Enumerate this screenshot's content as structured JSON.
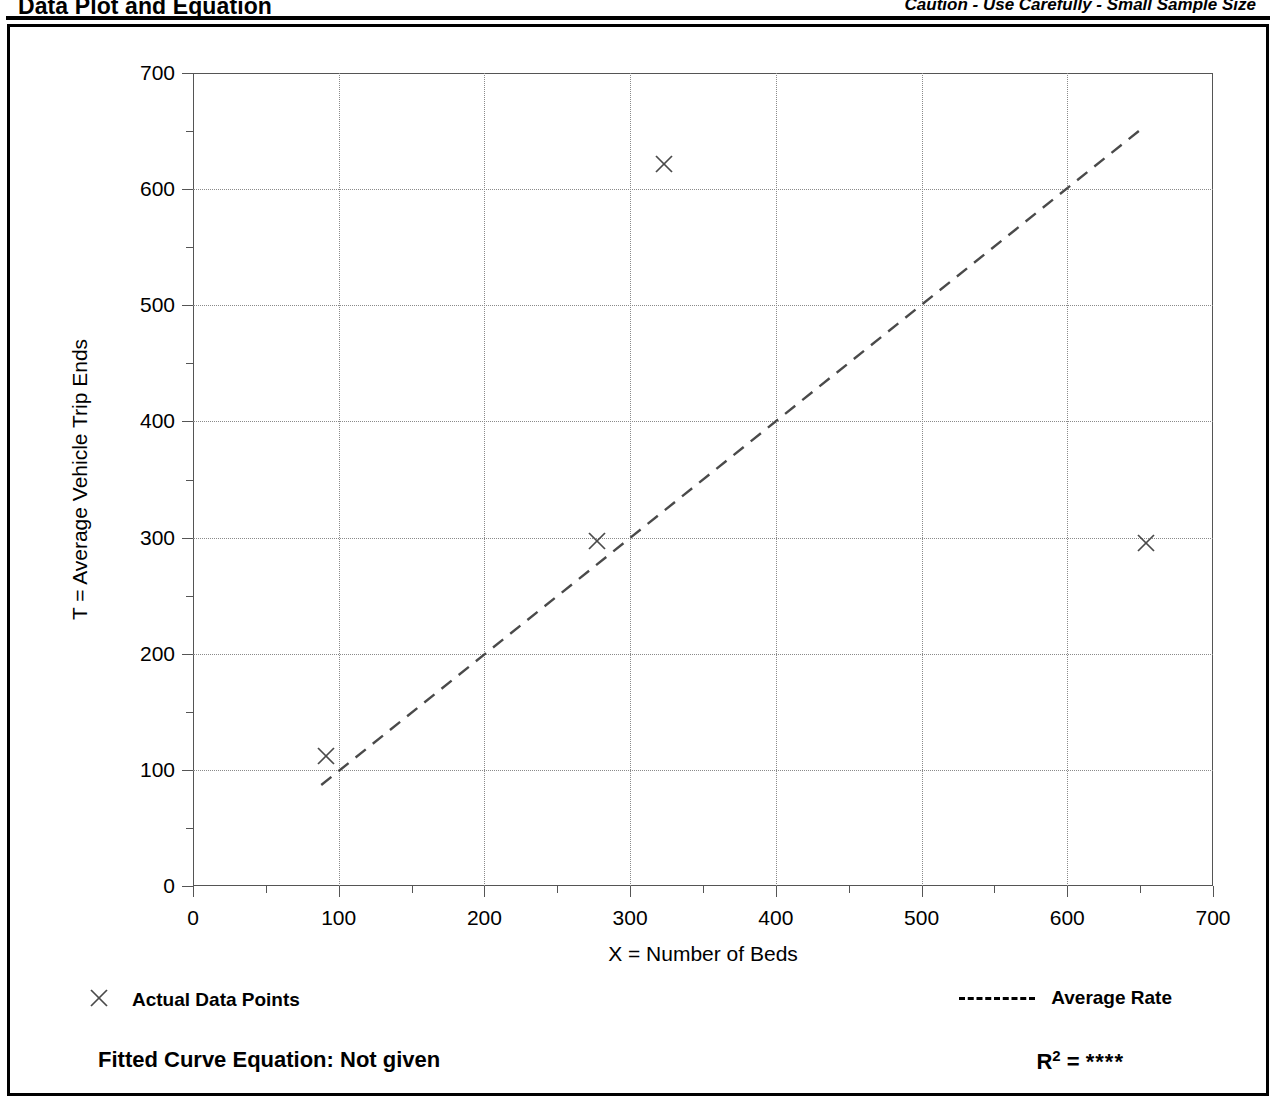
{
  "header": {
    "title": "Data Plot and Equation",
    "caution": "Caution - Use Carefully - Small Sample Size"
  },
  "axis_titles": {
    "y": "T = Average Vehicle Trip Ends",
    "x": "X = Number of Beds"
  },
  "legend": {
    "points_label": "Actual Data Points",
    "points_marker": "x-marker-icon",
    "rate_label": "Average Rate",
    "rate_marker": "dashed-line-icon"
  },
  "footer": {
    "equation_label": "Fitted Curve Equation:",
    "equation_value": "Not given",
    "equation_full": "Fitted Curve Equation:  Not given",
    "r_label": "R",
    "r_exponent": "2",
    "r_equals": "=",
    "r_value": "****"
  },
  "colors": {
    "frame": "#000000",
    "grid": "#8a8a8a",
    "axis": "#555555",
    "marker": "#4a4a4a",
    "trend": "#4a4a4a",
    "background": "#ffffff"
  },
  "chart_data": {
    "type": "scatter",
    "title": "Data Plot and Equation",
    "subtitle": "Caution - Use Carefully - Small Sample Size",
    "xlabel": "X = Number of Beds",
    "ylabel": "T = Average Vehicle Trip Ends",
    "xlim": [
      0,
      700
    ],
    "ylim": [
      0,
      700
    ],
    "xticks": [
      0,
      100,
      200,
      300,
      400,
      500,
      600,
      700
    ],
    "yticks": [
      0,
      100,
      200,
      300,
      400,
      500,
      600,
      700
    ],
    "xtick_labels": [
      "0",
      "100",
      "200",
      "300",
      "400",
      "500",
      "600",
      "700"
    ],
    "ytick_labels": [
      "0",
      "100",
      "200",
      "300",
      "400",
      "500",
      "600",
      "700"
    ],
    "minor_tick_interval": 50,
    "grid": true,
    "grid_style": "dotted",
    "legend_position": "below-plot",
    "series": [
      {
        "name": "Actual Data Points",
        "type": "scatter",
        "marker": "x",
        "points": [
          {
            "x": 91,
            "y": 112
          },
          {
            "x": 277,
            "y": 297
          },
          {
            "x": 323,
            "y": 622
          },
          {
            "x": 654,
            "y": 295
          }
        ]
      },
      {
        "name": "Average Rate",
        "type": "line",
        "style": "dashed",
        "endpoints": [
          {
            "x": 88,
            "y": 87
          },
          {
            "x": 650,
            "y": 651
          }
        ]
      }
    ],
    "fitted_curve_equation": "Not given",
    "r_squared": "****"
  }
}
